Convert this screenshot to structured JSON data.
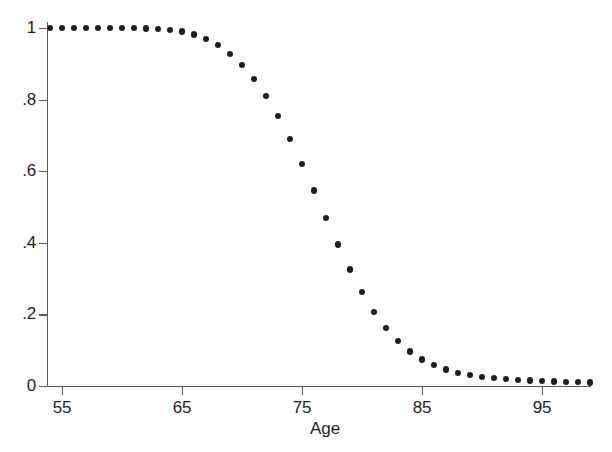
{
  "chart_data": {
    "type": "scatter",
    "title": "",
    "subtitle": "",
    "xlabel": "Age",
    "ylabel": "",
    "xlim": [
      53.0,
      100.0
    ],
    "ylim": [
      0,
      1
    ],
    "grid": false,
    "legend": null,
    "xticks": [
      55,
      65,
      75,
      85,
      95
    ],
    "xticklabels": [
      "55",
      "65",
      "75",
      "85",
      "95"
    ],
    "yticks": [
      0,
      0.2,
      0.4,
      0.6,
      0.8,
      1
    ],
    "yticklabels": [
      "0",
      ".2",
      ".4",
      ".6",
      ".8",
      "1"
    ],
    "marker": "filled-circle",
    "marker_color": "#1d1d1d",
    "axis_color": "#5a5a5a",
    "background_color": "#fdfdfd",
    "x": [
      54,
      55,
      56,
      57,
      58,
      59,
      60,
      61,
      62,
      63,
      64,
      65,
      66,
      67,
      68,
      69,
      70,
      71,
      72,
      73,
      74,
      75,
      76,
      77,
      78,
      79,
      80,
      81,
      82,
      83,
      84,
      85,
      86,
      87,
      88,
      89,
      90,
      91,
      92,
      93,
      94,
      95,
      96,
      97,
      98,
      99
    ],
    "y": [
      1.0,
      1.0,
      1.0,
      1.0,
      1.0,
      1.0,
      1.0,
      1.0,
      0.999,
      0.998,
      0.995,
      0.99,
      0.982,
      0.969,
      0.952,
      0.928,
      0.897,
      0.858,
      0.81,
      0.754,
      0.69,
      0.62,
      0.546,
      0.47,
      0.395,
      0.325,
      0.262,
      0.207,
      0.162,
      0.125,
      0.096,
      0.074,
      0.058,
      0.046,
      0.037,
      0.031,
      0.026,
      0.022,
      0.019,
      0.017,
      0.015,
      0.014,
      0.013,
      0.012,
      0.011,
      0.01
    ]
  },
  "axes": {
    "x_title": "Age"
  }
}
